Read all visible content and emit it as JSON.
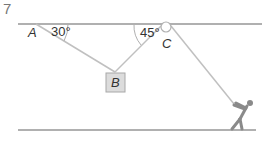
{
  "question_number": "7",
  "labels": {
    "A": "A",
    "B": "B",
    "C": "C",
    "angle_A": "30°",
    "angle_B_right": "45°"
  },
  "colors": {
    "line": "#b0b0b0",
    "box_fill": "#dcdcdc",
    "box_stroke": "#a8a8a8",
    "figure": "#8a8a8a",
    "text": "#333333"
  }
}
